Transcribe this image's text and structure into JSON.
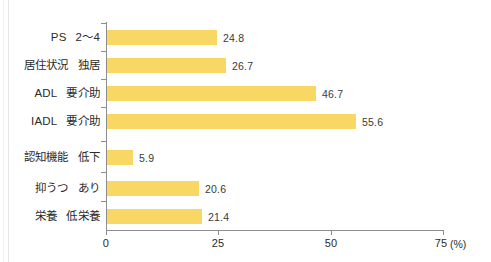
{
  "chart_data": {
    "type": "bar",
    "orientation": "horizontal",
    "title": "",
    "xlabel": "(%)",
    "ylabel": "",
    "xlim": [
      0,
      75
    ],
    "xticks": [
      "0",
      "25",
      "50",
      "75"
    ],
    "xtick_values": [
      0,
      25,
      50,
      75
    ],
    "unit": "(%)",
    "grid": false,
    "legend": false,
    "bar_color": "#f8d765",
    "categories": [
      "PS　2～4",
      "居住状況　独居",
      "ADL　要介助",
      "IADL　要介助",
      "認知機能　低下",
      "抑うつ　あり",
      "栄養　低栄養"
    ],
    "values": [
      24.8,
      26.7,
      46.7,
      55.6,
      5.9,
      20.6,
      21.4
    ],
    "value_labels": [
      "24.8",
      "26.7",
      "46.7",
      "55.6",
      "5.9",
      "20.6",
      "21.4"
    ],
    "rows": [
      {
        "group": "PS",
        "condition": "2～4",
        "value": 24.8,
        "value_label": "24.8"
      },
      {
        "group": "居住状況",
        "condition": "独居",
        "value": 26.7,
        "value_label": "26.7"
      },
      {
        "group": "ADL",
        "condition": "要介助",
        "value": 46.7,
        "value_label": "46.7"
      },
      {
        "group": "IADL",
        "condition": "要介助",
        "value": 55.6,
        "value_label": "55.6"
      },
      {
        "group": "認知機能",
        "condition": "低下",
        "value": 5.9,
        "value_label": "5.9"
      },
      {
        "group": "抑うつ",
        "condition": "あり",
        "value": 20.6,
        "value_label": "20.6"
      },
      {
        "group": "栄養",
        "condition": "低栄養",
        "value": 21.4,
        "value_label": "21.4"
      }
    ]
  }
}
